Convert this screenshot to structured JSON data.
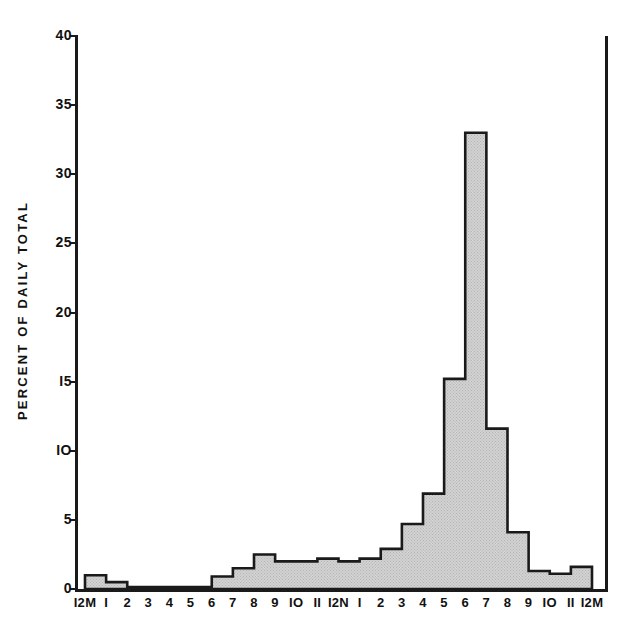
{
  "chart_data": {
    "type": "bar",
    "title": "",
    "subtitle": "",
    "xlabel": "",
    "ylabel": "PERCENT OF DAILY TOTAL",
    "ylim": [
      0,
      40
    ],
    "yticks": [
      0,
      5,
      10,
      15,
      20,
      25,
      30,
      35,
      40
    ],
    "ytick_labels": [
      "0",
      "5",
      "IO",
      "I5",
      "20",
      "25",
      "30",
      "35",
      "40"
    ],
    "grid": false,
    "legend": null,
    "annotations": [],
    "categories": [
      "12M-1",
      "1-2",
      "2-3",
      "3-4",
      "4-5",
      "5-6",
      "6-7",
      "7-8",
      "8-9",
      "9-10",
      "10-11",
      "11-12N",
      "12N-1",
      "1-2",
      "2-3",
      "3-4",
      "4-5",
      "5-6",
      "6-7",
      "7-8",
      "8-9",
      "9-10",
      "10-11",
      "11-12M"
    ],
    "xtick_labels": [
      "I2M",
      "I",
      "2",
      "3",
      "4",
      "5",
      "6",
      "7",
      "8",
      "9",
      "IO",
      "II",
      "I2N",
      "I",
      "2",
      "3",
      "4",
      "5",
      "6",
      "7",
      "8",
      "9",
      "IO",
      "II",
      "I2M"
    ],
    "values": [
      1.0,
      0.5,
      0.15,
      0.15,
      0.15,
      0.15,
      0.9,
      1.5,
      2.5,
      2.0,
      2.0,
      2.2,
      2.0,
      2.2,
      2.9,
      4.7,
      6.9,
      15.2,
      33.0,
      11.6,
      4.1,
      1.3,
      1.1,
      1.6
    ],
    "series_color": "#c9c9c9",
    "outline_color": "#1a1a1a"
  },
  "axes": {
    "y_axis_label": "PERCENT OF DAILY TOTAL"
  }
}
